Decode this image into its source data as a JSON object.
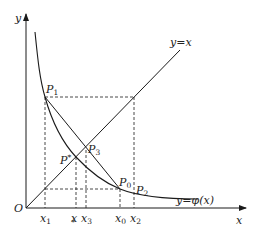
{
  "diagram": {
    "type": "fixed-point-iteration-graph",
    "axes": {
      "x_label": "x",
      "y_label": "y",
      "origin_label": "O"
    },
    "curves": {
      "line_label": "y=x",
      "phi_label": "y=φ(x)"
    },
    "points": [
      {
        "name": "P1",
        "base": "P",
        "sub": "1"
      },
      {
        "name": "P3",
        "base": "P",
        "sub": "3"
      },
      {
        "name": "P*",
        "base": "P",
        "sub": "*"
      },
      {
        "name": "P0",
        "base": "P",
        "sub": "0"
      },
      {
        "name": "P2",
        "base": "P",
        "sub": "2"
      }
    ],
    "x_ticks": [
      {
        "name": "x1",
        "base": "x",
        "sub": "1"
      },
      {
        "name": "x*",
        "base": "x",
        "sub": "*"
      },
      {
        "name": "x3",
        "base": "x",
        "sub": "3"
      },
      {
        "name": "x0",
        "base": "x",
        "sub": "0"
      },
      {
        "name": "x2",
        "base": "x",
        "sub": "2"
      }
    ],
    "colors": {
      "stroke": "#1a1a1a",
      "background": "#ffffff"
    }
  }
}
